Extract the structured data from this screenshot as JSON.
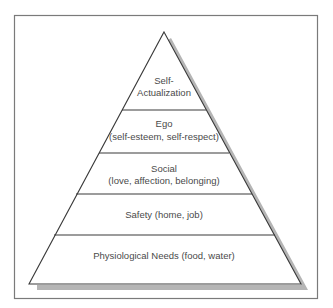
{
  "diagram": {
    "type": "pyramid",
    "levels": [
      {
        "name": "self-actualization",
        "lines": [
          "Self-",
          "Actualization"
        ]
      },
      {
        "name": "ego",
        "lines": [
          "Ego",
          "(self-esteem, self-respect)"
        ]
      },
      {
        "name": "social",
        "lines": [
          "Social",
          "(love, affection, belonging)"
        ]
      },
      {
        "name": "safety",
        "lines": [
          "Safety (home, job)"
        ]
      },
      {
        "name": "physiological",
        "lines": [
          "Physiological Needs (food, water)"
        ]
      }
    ],
    "colors": {
      "frame": "#7a7a7a",
      "outline": "#3a3a3a",
      "shadow": "#b5b5b5",
      "text": "#4a4a4a",
      "background": "#ffffff"
    }
  }
}
